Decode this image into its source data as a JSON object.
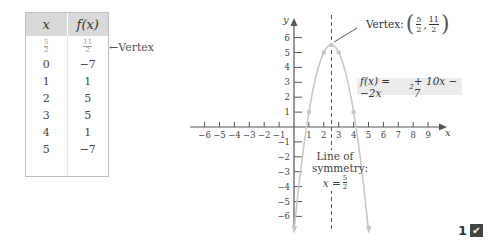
{
  "table": {
    "headers": [
      "x",
      "f(x)"
    ],
    "vertex_row": {
      "x_num": "5",
      "x_den": "2",
      "fx_num": "11",
      "fx_den": "2"
    },
    "rows": [
      {
        "x": "0",
        "fx": "−7"
      },
      {
        "x": "1",
        "fx": "1"
      },
      {
        "x": "2",
        "fx": "5"
      },
      {
        "x": "3",
        "fx": "5"
      },
      {
        "x": "4",
        "fx": "1"
      },
      {
        "x": "5",
        "fx": "−7"
      }
    ],
    "vertex_label": "←Vertex"
  },
  "graph": {
    "x_axis_label": "x",
    "y_axis_label": "y",
    "x_ticks": [
      "−6",
      "−5",
      "−4",
      "−3",
      "−2",
      "−1",
      "1",
      "2",
      "3",
      "4",
      "5",
      "6",
      "7",
      "8",
      "9"
    ],
    "y_ticks": [
      "6",
      "5",
      "4",
      "3",
      "2",
      "1",
      "−1",
      "−2",
      "−3",
      "−4",
      "−5",
      "−6"
    ],
    "equation": {
      "prefix": "f(x) = −2x",
      "exp": "2",
      "suffix": " + 10x − 7"
    },
    "vertex_annotation": {
      "label": "Vertex:",
      "x_num": "5",
      "x_den": "2",
      "y_num": "11",
      "y_den": "2"
    },
    "symmetry_label": {
      "line1": "Line of",
      "line2": "symmetry:",
      "eq_prefix": "x =",
      "num": "5",
      "den": "2"
    },
    "points": [
      [
        1,
        1
      ],
      [
        2,
        5
      ],
      [
        2.5,
        5.5
      ],
      [
        3,
        5
      ],
      [
        4,
        1
      ]
    ],
    "curve_color": "#c8c8c8"
  },
  "badge": {
    "number": "1",
    "icon": "✔"
  }
}
